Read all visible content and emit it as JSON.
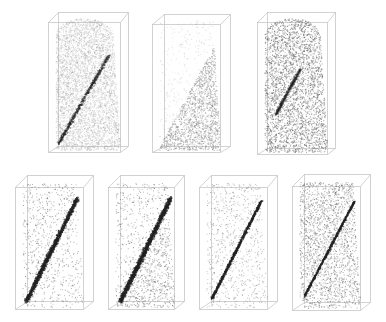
{
  "figure": {
    "background": "#ffffff",
    "box_color": "#c8c8c8",
    "rows": [
      {
        "name": "top-row",
        "panels": [
          {
            "id": "p1",
            "x": 48,
            "y": 12,
            "w": 86,
            "h": 142,
            "front": {
              "x": 10,
              "y": 4,
              "w": 70,
              "h": 134
            },
            "style": "mottled-with-faint-band",
            "density": 5500,
            "dot_color": "#8a8a8a",
            "dot_alpha": 0.35,
            "band": {
              "x0": 0.08,
              "y0": 0.95,
              "x1": 0.78,
              "y1": 0.28,
              "width": 0.035,
              "alpha": 0.55
            },
            "shape_top_round": true
          },
          {
            "id": "p2",
            "x": 152,
            "y": 14,
            "w": 82,
            "h": 140,
            "front": {
              "x": 12,
              "y": 4,
              "w": 66,
              "h": 132
            },
            "style": "split-wedge",
            "density": 7000,
            "dot_color": "#8a8a8a",
            "dot_alpha": 0.35,
            "wedge": {
              "x0": 0.05,
              "y0": 0.97,
              "x1": 0.85,
              "y1": 0.2
            },
            "light_density": 0.12,
            "shape_top_round": false
          },
          {
            "id": "p3",
            "x": 257,
            "y": 12,
            "w": 84,
            "h": 144,
            "front": {
              "x": 10,
              "y": 4,
              "w": 68,
              "h": 136
            },
            "style": "uniform-dense",
            "density": 6500,
            "dot_color": "#6a6a6a",
            "dot_alpha": 0.45,
            "band": {
              "x0": 0.2,
              "y0": 0.72,
              "x1": 0.55,
              "y1": 0.38,
              "width": 0.03,
              "alpha": 0.3
            },
            "shape_top_round": true
          }
        ]
      },
      {
        "name": "bottom-row",
        "panels": [
          {
            "id": "p4",
            "x": 15,
            "y": 175,
            "w": 82,
            "h": 138,
            "front": {
              "x": 12,
              "y": 6,
              "w": 66,
              "h": 126
            },
            "style": "sparse-with-strong-band",
            "density": 900,
            "dot_color": "#555555",
            "dot_alpha": 0.55,
            "band": {
              "x0": 0.1,
              "y0": 0.95,
              "x1": 0.85,
              "y1": 0.12,
              "width": 0.045,
              "alpha": 0.85,
              "count": 1700
            }
          },
          {
            "id": "p5",
            "x": 108,
            "y": 175,
            "w": 80,
            "h": 138,
            "front": {
              "x": 12,
              "y": 6,
              "w": 64,
              "h": 126
            },
            "style": "lower-dense-with-strong-band",
            "density": 1900,
            "dot_color": "#555555",
            "dot_alpha": 0.55,
            "band": {
              "x0": 0.12,
              "y0": 0.95,
              "x1": 0.88,
              "y1": 0.12,
              "width": 0.05,
              "alpha": 0.85,
              "count": 1900
            }
          },
          {
            "id": "p6",
            "x": 199,
            "y": 175,
            "w": 82,
            "h": 138,
            "front": {
              "x": 12,
              "y": 6,
              "w": 66,
              "h": 126
            },
            "style": "sparse-with-thin-band",
            "density": 900,
            "dot_color": "#666666",
            "dot_alpha": 0.5,
            "band": {
              "x0": 0.12,
              "y0": 0.93,
              "x1": 0.85,
              "y1": 0.14,
              "width": 0.025,
              "alpha": 0.85,
              "count": 1100
            }
          },
          {
            "id": "p7",
            "x": 292,
            "y": 174,
            "w": 82,
            "h": 140,
            "front": {
              "x": 12,
              "y": 6,
              "w": 66,
              "h": 128
            },
            "style": "moderate-with-thin-band",
            "density": 2400,
            "dot_color": "#555555",
            "dot_alpha": 0.55,
            "band": {
              "x0": 0.12,
              "y0": 0.9,
              "x1": 0.85,
              "y1": 0.15,
              "width": 0.02,
              "alpha": 0.85,
              "count": 900
            }
          }
        ]
      }
    ]
  }
}
